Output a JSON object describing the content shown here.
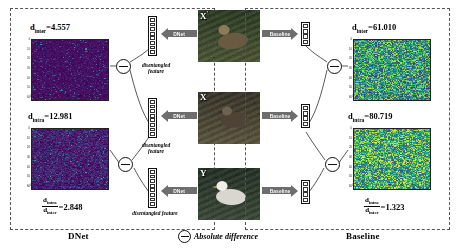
{
  "figure": {
    "left_panel_caption": "DNet",
    "right_panel_caption": "Baseline",
    "legend_label": "Absolute difference",
    "legend_icon": "circled-minus-icon",
    "disentangled_feature_line1": "disentangled",
    "disentangled_feature_line2": "feature"
  },
  "images": {
    "top": {
      "tag": "X",
      "sup": "'",
      "name": "duck-swimming"
    },
    "middle": {
      "tag": "X",
      "sup": "",
      "name": "duck-on-water"
    },
    "bottom": {
      "tag": "Y",
      "sup": "",
      "name": "albatross"
    }
  },
  "arrows": {
    "dnet_top": "DNet",
    "dnet_mid": "DNet",
    "dnet_bot": "DNet",
    "base_top": "Baseline",
    "base_mid": "Baseline",
    "base_bot": "Baseline"
  },
  "metrics": {
    "dnet_inter": {
      "symbol": "d",
      "sub": "inter",
      "eq": "=",
      "value": "4.557",
      "text": "d_inter=4.557"
    },
    "dnet_intra": {
      "symbol": "d",
      "sub": "intra",
      "eq": "=",
      "value": "12.981",
      "text": "d_intra=12.981"
    },
    "dnet_ratio": {
      "num_sub": "intra",
      "den_sub": "inter",
      "eq": "=",
      "value": "2.848"
    },
    "base_inter": {
      "symbol": "d",
      "sub": "inter",
      "eq": "=",
      "value": "61.010",
      "text": "d_inter=61.010"
    },
    "base_intra": {
      "symbol": "d",
      "sub": "intra",
      "eq": "=",
      "value": "80.719",
      "text": "d_intra=80.719"
    },
    "base_ratio": {
      "num_sub": "intra",
      "den_sub": "inter",
      "eq": "=",
      "value": "1.323"
    }
  },
  "chart_data": {
    "type": "heatmap",
    "panels": [
      {
        "id": "dnet-inter-heatmap",
        "panel": "DNet",
        "label": "d_inter=4.557",
        "metric_name": "d_inter",
        "metric_value": 4.557,
        "description": "Absolute difference between disentangled features of X' and X (inter-instance, same class)",
        "colormap": "viridis-dark",
        "mean_intensity_norm": 0.07,
        "grid": false,
        "xlim": [
          0,
          64
        ],
        "ylim": [
          0,
          64
        ],
        "xticks": [
          0,
          10,
          20,
          30,
          40,
          50,
          60
        ],
        "yticks": [
          0,
          10,
          20,
          30,
          40,
          50,
          60
        ]
      },
      {
        "id": "dnet-intra-heatmap",
        "panel": "DNet",
        "label": "d_intra=12.981",
        "metric_name": "d_intra",
        "metric_value": 12.981,
        "description": "Absolute difference between disentangled features of X and Y (intra/cross class)",
        "colormap": "viridis-dark",
        "mean_intensity_norm": 0.15,
        "grid": false,
        "xlim": [
          0,
          64
        ],
        "ylim": [
          0,
          64
        ],
        "xticks": [
          0,
          10,
          20,
          30,
          40,
          50,
          60
        ],
        "yticks": [
          0,
          10,
          20,
          30,
          40,
          50,
          60
        ]
      },
      {
        "id": "base-inter-heatmap",
        "panel": "Baseline",
        "label": "d_inter=61.010",
        "metric_name": "d_inter",
        "metric_value": 61.01,
        "description": "Absolute difference between baseline features of X' and X",
        "colormap": "viridis-bright",
        "mean_intensity_norm": 0.55,
        "grid": false,
        "xlim": [
          0,
          64
        ],
        "ylim": [
          0,
          64
        ],
        "xticks": [
          0,
          10,
          20,
          30,
          40,
          50,
          60
        ],
        "yticks": [
          0,
          10,
          20,
          30,
          40,
          50,
          60
        ]
      },
      {
        "id": "base-intra-heatmap",
        "panel": "Baseline",
        "label": "d_intra=80.719",
        "metric_name": "d_intra",
        "metric_value": 80.719,
        "description": "Absolute difference between baseline features of X and Y",
        "colormap": "viridis-bright",
        "mean_intensity_norm": 0.62,
        "grid": false,
        "xlim": [
          0,
          64
        ],
        "ylim": [
          0,
          64
        ],
        "xticks": [
          0,
          10,
          20,
          30,
          40,
          50,
          60
        ],
        "yticks": [
          0,
          10,
          20,
          30,
          40,
          50,
          60
        ]
      }
    ],
    "ratios": [
      {
        "panel": "DNet",
        "name": "d_intra/d_inter",
        "value": 2.848
      },
      {
        "panel": "Baseline",
        "name": "d_intra/d_inter",
        "value": 1.323
      }
    ]
  }
}
